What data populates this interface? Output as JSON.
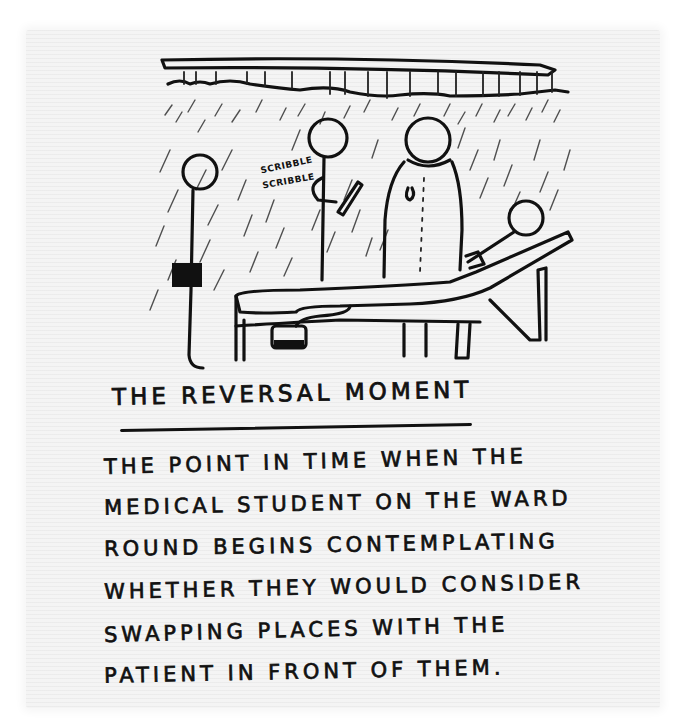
{
  "cartoon": {
    "scene": "hospital ward round at bedside under shower-like ceiling",
    "figures": [
      {
        "role": "medical-student",
        "holding": "clipboard"
      },
      {
        "role": "junior-doctor",
        "action": "writing notes"
      },
      {
        "role": "consultant",
        "attire": "white coat"
      },
      {
        "role": "patient",
        "position": "lying in hospital bed"
      }
    ],
    "sound_effect": {
      "line1": "SCRIBBLE",
      "line2": "SCRIBBLE"
    }
  },
  "caption": {
    "title": "THE REVERSAL MOMENT",
    "lines": [
      "THE POINT IN TIME WHEN THE",
      "MEDICAL STUDENT ON THE WARD",
      "ROUND BEGINS CONTEMPLATING",
      "WHETHER THEY WOULD CONSIDER",
      "SWAPPING PLACES WITH THE",
      "PATIENT IN FRONT OF THEM."
    ]
  },
  "colors": {
    "ink": "#111111",
    "paper": "#f4f4f4",
    "background": "#ffffff"
  }
}
